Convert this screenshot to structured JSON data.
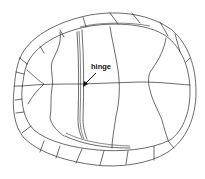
{
  "figure": {
    "annotations": [
      {
        "id": "hinge",
        "text": "hinge",
        "x": 90,
        "y": 63
      }
    ],
    "colors": {
      "line": "#2b2b2b",
      "background": "#ffffff"
    }
  }
}
